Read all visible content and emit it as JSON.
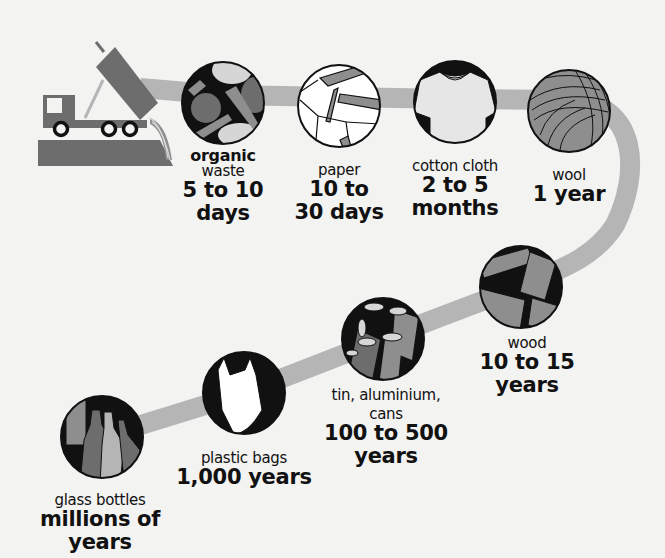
{
  "colors": {
    "background": "#f3f3f1",
    "path": "#b5b5b5",
    "dark_gray": "#6d6d6d",
    "mid_gray": "#8e8e8e",
    "light_gray": "#d6d6d6",
    "black": "#111111"
  },
  "truck": {
    "icon": "dump-truck-icon"
  },
  "items": [
    {
      "id": "organic",
      "name_bold": "organic",
      "name": "waste",
      "duration_1": "5 to 10",
      "duration_2": "days",
      "icon": "fruit-vegetables-icon"
    },
    {
      "id": "paper",
      "name": "paper",
      "duration_1": "10 to",
      "duration_2": "30 days",
      "icon": "paper-icon"
    },
    {
      "id": "cotton",
      "name": "cotton cloth",
      "duration_1": "2 to 5",
      "duration_2": "months",
      "icon": "tshirt-icon"
    },
    {
      "id": "wool",
      "name": "wool",
      "duration_1": "1 year",
      "icon": "yarn-ball-icon"
    },
    {
      "id": "wood",
      "name": "wood",
      "duration_1": "10 to 15",
      "duration_2": "years",
      "icon": "wood-planks-icon"
    },
    {
      "id": "tin",
      "name": "tin, aluminium,",
      "name_2": "cans",
      "duration_1": "100 to 500",
      "duration_2": "years",
      "icon": "cans-icon"
    },
    {
      "id": "plastic",
      "name": "plastic bags",
      "duration_1": "1,000 years",
      "icon": "plastic-bag-icon"
    },
    {
      "id": "glass",
      "name": "glass bottles",
      "duration_1": "millions of",
      "duration_2": "years",
      "icon": "glass-bottles-icon"
    }
  ]
}
